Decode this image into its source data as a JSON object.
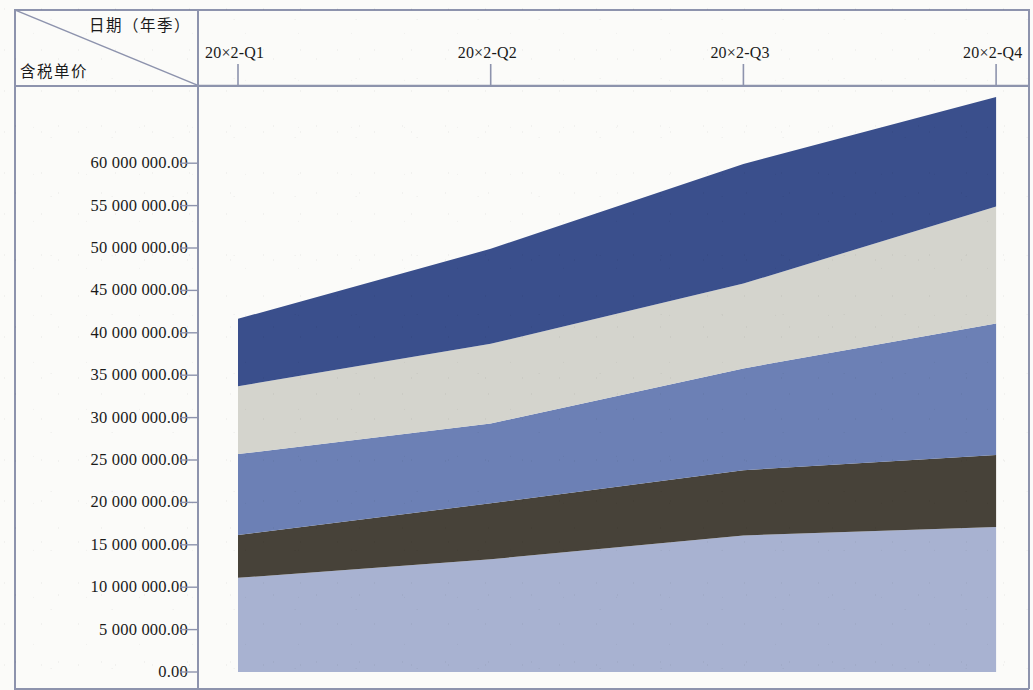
{
  "header": {
    "corner_top_label": "日期（年季）",
    "corner_bottom_label": "含税单价"
  },
  "chart_data": {
    "type": "area",
    "stacked": true,
    "title": "",
    "xlabel": "日期（年季）",
    "ylabel": "含税单价",
    "categories": [
      "20×2-Q1",
      "20×2-Q2",
      "20×2-Q3",
      "20×2-Q4"
    ],
    "x_tick_labels": [
      "20×2-Q1",
      "20×2-Q2",
      "20×2-Q3",
      "20×2-Q4"
    ],
    "y_tick_labels": [
      "60 000 000.00",
      "55 000 000.00",
      "50 000 000.00",
      "45 000 000.00",
      "40 000 000.00",
      "35 000 000.00",
      "30 000 000.00",
      "25 000 000.00",
      "20 000 000.00",
      "15 000 000.00",
      "10 000 000.00",
      "5 000 000.00",
      "0.00"
    ],
    "y_tick_values": [
      60000000,
      55000000,
      50000000,
      45000000,
      40000000,
      35000000,
      30000000,
      25000000,
      20000000,
      15000000,
      10000000,
      5000000,
      0
    ],
    "ylim": [
      0,
      63000000
    ],
    "grid": false,
    "legend": "none",
    "series": [
      {
        "name": "series-1",
        "color": "#a8b2d1",
        "stack_order": 1,
        "values": [
          11100000,
          13300000,
          16100000,
          17100000
        ]
      },
      {
        "name": "series-2",
        "color": "#474239",
        "stack_order": 2,
        "values": [
          5050000,
          6600000,
          7700000,
          8500000
        ]
      },
      {
        "name": "series-3",
        "color": "#6c80b5",
        "stack_order": 3,
        "values": [
          9550000,
          9400000,
          12000000,
          15500000
        ]
      },
      {
        "name": "series-4",
        "color": "#d4d4cd",
        "stack_order": 4,
        "values": [
          8000000,
          9400000,
          10000000,
          13800000
        ]
      },
      {
        "name": "series-5",
        "color": "#3a4f8c",
        "stack_order": 5,
        "values": [
          7950000,
          11200000,
          14100000,
          12900000
        ]
      }
    ],
    "cumulative_tops": {
      "series-1": [
        11100000,
        13300000,
        16100000,
        17100000
      ],
      "series-2": [
        16150000,
        19900000,
        23800000,
        25600000
      ],
      "series-3": [
        25700000,
        29300000,
        35800000,
        41100000
      ],
      "series-4": [
        33700000,
        38700000,
        45800000,
        54900000
      ],
      "series-5": [
        41650000,
        49900000,
        59900000,
        67800000
      ]
    },
    "colors": {
      "band_bottom": "#a8b2d1",
      "band_dark": "#474239",
      "band_blue": "#6c80b5",
      "band_gray": "#d4d4cd",
      "band_navy": "#3a4f8c",
      "axis": "#8d93ad",
      "text": "#1a1a1a",
      "background": "#fbfbf9"
    }
  }
}
